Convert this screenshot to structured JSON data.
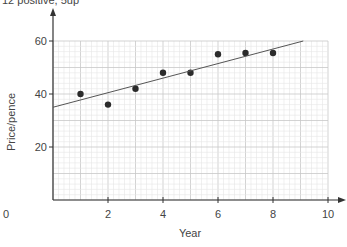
{
  "caption": "12 positive, 5up",
  "chart_data": {
    "type": "scatter",
    "title": "",
    "xlabel": "Year",
    "ylabel": "Price/pence",
    "xlim": [
      0,
      10
    ],
    "ylim": [
      0,
      60
    ],
    "xticks": [
      0,
      2,
      4,
      6,
      8,
      10
    ],
    "yticks": [
      20,
      40,
      60
    ],
    "grid": true,
    "series": [
      {
        "name": "Price",
        "type": "scatter",
        "x": [
          1,
          2,
          3,
          4,
          5,
          6,
          7,
          8
        ],
        "y": [
          40,
          36,
          42,
          48,
          48,
          55,
          55.5,
          55.5
        ]
      },
      {
        "name": "Line of best fit",
        "type": "line",
        "x": [
          0,
          9.1
        ],
        "y": [
          35,
          60
        ]
      }
    ]
  },
  "colors": {
    "axis": "#333333",
    "grid_major": "#c8c8c8",
    "grid_minor": "#e6e6e6",
    "point": "#2b2b2b",
    "line": "#555555"
  }
}
